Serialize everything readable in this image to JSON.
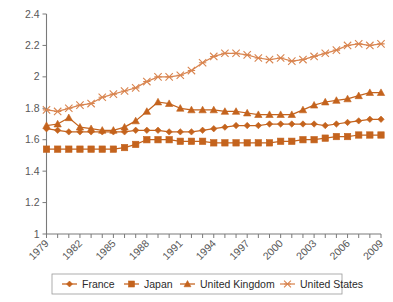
{
  "chart_data": {
    "type": "line",
    "title": "",
    "subtitle": "",
    "xlabel": "",
    "ylabel": "",
    "xlim": [
      1979,
      2009
    ],
    "ylim": [
      1.0,
      2.4
    ],
    "ytick_values": [
      1,
      1.2,
      1.4,
      1.6,
      1.8,
      2,
      2.2,
      2.4
    ],
    "ytick_labels": [
      "1",
      "1.2",
      "1.4",
      "1.6",
      "1.8",
      "2",
      "2.2",
      "2.4"
    ],
    "x": [
      1979,
      1980,
      1981,
      1982,
      1983,
      1984,
      1985,
      1986,
      1987,
      1988,
      1989,
      1990,
      1991,
      1992,
      1993,
      1994,
      1995,
      1996,
      1997,
      1998,
      1999,
      2000,
      2001,
      2002,
      2003,
      2004,
      2005,
      2006,
      2007,
      2008,
      2009
    ],
    "xtick_labels": [
      "1979",
      "1982",
      "1985",
      "1988",
      "1991",
      "1994",
      "1997",
      "2000",
      "2003",
      "2006",
      "2009"
    ],
    "xtick_values": [
      1979,
      1982,
      1985,
      1988,
      1991,
      1994,
      1997,
      2000,
      2003,
      2006,
      2009
    ],
    "xtick_every": 3,
    "grid": false,
    "legend_position": "bottom",
    "marker_size": 3.2,
    "series": [
      {
        "name": "France",
        "marker": "diamond",
        "color": "#C4631D",
        "values": [
          1.67,
          1.66,
          1.65,
          1.65,
          1.65,
          1.65,
          1.65,
          1.65,
          1.66,
          1.66,
          1.66,
          1.65,
          1.65,
          1.65,
          1.66,
          1.67,
          1.68,
          1.69,
          1.69,
          1.69,
          1.7,
          1.7,
          1.7,
          1.7,
          1.7,
          1.69,
          1.7,
          1.71,
          1.72,
          1.73,
          1.73
        ]
      },
      {
        "name": "Japan",
        "marker": "square",
        "color": "#C4631D",
        "values": [
          1.54,
          1.54,
          1.54,
          1.54,
          1.54,
          1.54,
          1.54,
          1.55,
          1.57,
          1.6,
          1.6,
          1.6,
          1.59,
          1.59,
          1.59,
          1.58,
          1.58,
          1.58,
          1.58,
          1.58,
          1.58,
          1.59,
          1.59,
          1.6,
          1.6,
          1.61,
          1.62,
          1.62,
          1.63,
          1.63,
          1.63
        ]
      },
      {
        "name": "United Kingdom",
        "marker": "triangle",
        "color": "#C4631D",
        "values": [
          1.69,
          1.7,
          1.74,
          1.68,
          1.67,
          1.66,
          1.66,
          1.68,
          1.72,
          1.78,
          1.84,
          1.83,
          1.8,
          1.79,
          1.79,
          1.79,
          1.78,
          1.78,
          1.77,
          1.76,
          1.76,
          1.76,
          1.76,
          1.79,
          1.82,
          1.84,
          1.85,
          1.86,
          1.88,
          1.9,
          1.9
        ]
      },
      {
        "name": "United States",
        "marker": "cross",
        "color": "#D98550",
        "values": [
          1.79,
          1.78,
          1.8,
          1.82,
          1.83,
          1.87,
          1.89,
          1.91,
          1.93,
          1.97,
          2.0,
          2.0,
          2.01,
          2.04,
          2.09,
          2.13,
          2.15,
          2.15,
          2.14,
          2.12,
          2.11,
          2.12,
          2.1,
          2.11,
          2.13,
          2.15,
          2.17,
          2.2,
          2.21,
          2.2,
          2.21
        ]
      }
    ]
  },
  "legend": {
    "items": [
      {
        "label": "France",
        "marker": "diamond"
      },
      {
        "label": "Japan",
        "marker": "square"
      },
      {
        "label": "United Kingdom",
        "marker": "triangle"
      },
      {
        "label": "United States",
        "marker": "cross"
      }
    ]
  }
}
